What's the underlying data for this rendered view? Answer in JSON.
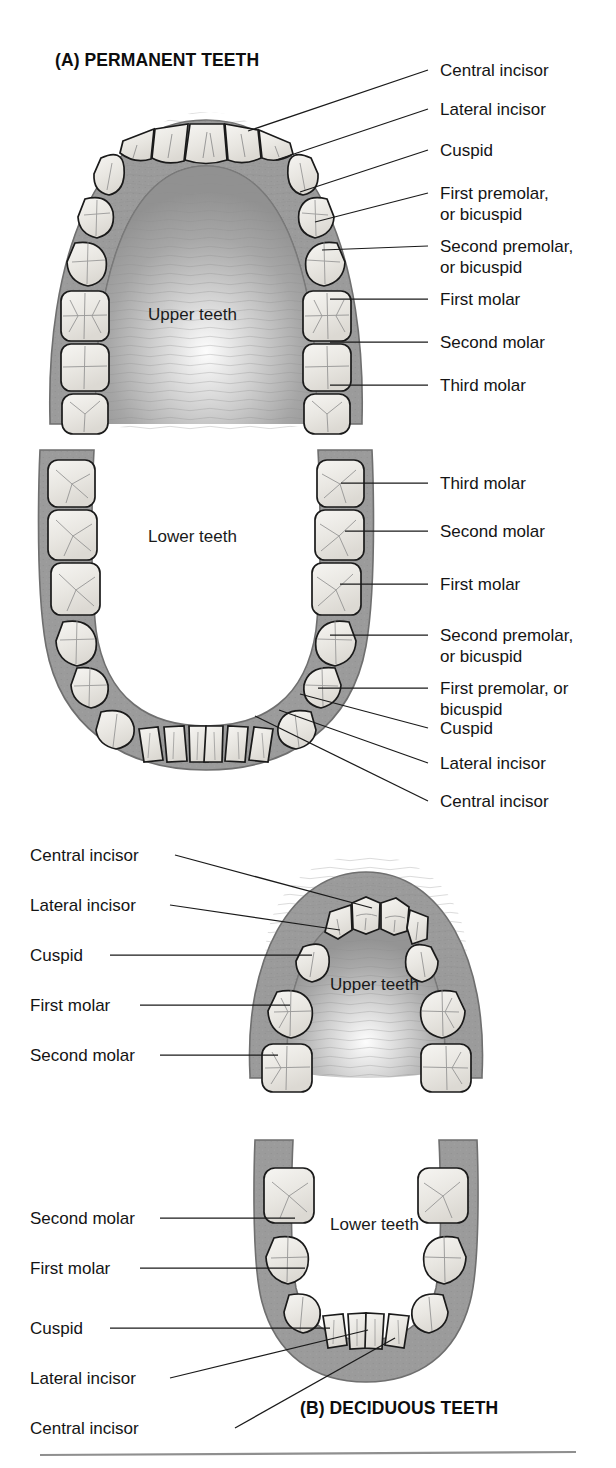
{
  "figure": {
    "kind": "anatomical-diagram",
    "bottom_rule": true
  },
  "colors": {
    "gum_fill": "#9b9b9b",
    "gum_edge": "#7d7d7d",
    "palate_fill": "#a3a3a3",
    "tooth_fill": "#eceae6",
    "tooth_edge": "#1a1a1a",
    "tooth_groove": "#8d8d8d",
    "leader_line": "#1a1a1a",
    "text": "#141414",
    "rule": "#8f8f8f",
    "background": "#ffffff"
  },
  "sections": {
    "a": {
      "id": "A",
      "title": "(A) PERMANENT TEETH",
      "upper_caption": "Upper teeth",
      "lower_caption": "Lower teeth",
      "upper_labels": [
        {
          "text": "Central incisor",
          "x": 440,
          "y": 60,
          "tip_x": 248,
          "tip_y": 131,
          "elbow_x": 428,
          "elbow_y": 70
        },
        {
          "text": "Lateral incisor",
          "x": 440,
          "y": 99,
          "tip_x": 276,
          "tip_y": 160,
          "elbow_x": 428,
          "elbow_y": 109
        },
        {
          "text": "Cuspid",
          "x": 440,
          "y": 140,
          "tip_x": 300,
          "tip_y": 192,
          "elbow_x": 428,
          "elbow_y": 150
        },
        {
          "text": "First premolar,\nor bicuspid",
          "x": 440,
          "y": 183,
          "tip_x": 315,
          "tip_y": 222,
          "elbow_x": 428,
          "elbow_y": 193
        },
        {
          "text": "Second premolar,\nor bicuspid",
          "x": 440,
          "y": 236,
          "tip_x": 322,
          "tip_y": 250,
          "elbow_x": 428,
          "elbow_y": 246
        },
        {
          "text": "First molar",
          "x": 440,
          "y": 289,
          "tip_x": 330,
          "tip_y": 299,
          "elbow_x": 428,
          "elbow_y": 299
        },
        {
          "text": "Second molar",
          "x": 440,
          "y": 332,
          "tip_x": 330,
          "tip_y": 342,
          "elbow_x": 428,
          "elbow_y": 342
        },
        {
          "text": "Third molar",
          "x": 440,
          "y": 375,
          "tip_x": 330,
          "tip_y": 385,
          "elbow_x": 428,
          "elbow_y": 385
        }
      ],
      "lower_labels": [
        {
          "text": "Third molar",
          "x": 440,
          "y": 473,
          "tip_x": 341,
          "tip_y": 483,
          "elbow_x": 428,
          "elbow_y": 483
        },
        {
          "text": "Second molar",
          "x": 440,
          "y": 521,
          "tip_x": 345,
          "tip_y": 531,
          "elbow_x": 428,
          "elbow_y": 531
        },
        {
          "text": "Lateral incisor",
          "x": 440,
          "y": 753,
          "tip_x": 279,
          "tip_y": 710,
          "elbow_x": 428,
          "elbow_y": 763
        },
        {
          "text": "First molar",
          "x": 440,
          "y": 574,
          "tip_x": 340,
          "tip_y": 584,
          "elbow_x": 428,
          "elbow_y": 584
        },
        {
          "text": "Second premolar,\nor bicuspid",
          "x": 440,
          "y": 625,
          "tip_x": 330,
          "tip_y": 635,
          "elbow_x": 428,
          "elbow_y": 635
        },
        {
          "text": "First premolar, or\nbicuspid",
          "x": 440,
          "y": 678,
          "tip_x": 318,
          "tip_y": 688,
          "elbow_x": 428,
          "elbow_y": 688
        },
        {
          "text": "Cuspid",
          "x": 440,
          "y": 718,
          "tip_x": 300,
          "tip_y": 694,
          "elbow_x": 428,
          "elbow_y": 728
        },
        {
          "text": "Central incisor",
          "x": 440,
          "y": 791,
          "tip_x": 255,
          "tip_y": 716,
          "elbow_x": 428,
          "elbow_y": 801
        }
      ]
    },
    "b": {
      "id": "B",
      "title": "(B) DECIDUOUS TEETH",
      "upper_caption": "Upper teeth",
      "lower_caption": "Lower teeth",
      "upper_labels": [
        {
          "text": "Central incisor",
          "x": 30,
          "y": 845,
          "tip_x": 372,
          "tip_y": 908,
          "elbow_x": 175,
          "elbow_y": 855
        },
        {
          "text": "Lateral incisor",
          "x": 30,
          "y": 895,
          "tip_x": 340,
          "tip_y": 930,
          "elbow_x": 170,
          "elbow_y": 905
        },
        {
          "text": "Cuspid",
          "x": 30,
          "y": 945,
          "tip_x": 312,
          "tip_y": 955,
          "elbow_x": 110,
          "elbow_y": 955
        },
        {
          "text": "First molar",
          "x": 30,
          "y": 995,
          "tip_x": 290,
          "tip_y": 1005,
          "elbow_x": 140,
          "elbow_y": 1005
        },
        {
          "text": "Second molar",
          "x": 30,
          "y": 1045,
          "tip_x": 278,
          "tip_y": 1055,
          "elbow_x": 160,
          "elbow_y": 1055
        }
      ],
      "lower_labels": [
        {
          "text": "Second molar",
          "x": 30,
          "y": 1208,
          "tip_x": 295,
          "tip_y": 1218,
          "elbow_x": 160,
          "elbow_y": 1218
        },
        {
          "text": "First molar",
          "x": 30,
          "y": 1258,
          "tip_x": 305,
          "tip_y": 1268,
          "elbow_x": 140,
          "elbow_y": 1268
        },
        {
          "text": "Cuspid",
          "x": 30,
          "y": 1318,
          "tip_x": 330,
          "tip_y": 1328,
          "elbow_x": 110,
          "elbow_y": 1328
        },
        {
          "text": "Lateral incisor",
          "x": 30,
          "y": 1368,
          "tip_x": 368,
          "tip_y": 1330,
          "elbow_x": 170,
          "elbow_y": 1378
        },
        {
          "text": "Central incisor",
          "x": 30,
          "y": 1418,
          "tip_x": 395,
          "tip_y": 1338,
          "elbow_x": 235,
          "elbow_y": 1428
        }
      ]
    }
  }
}
